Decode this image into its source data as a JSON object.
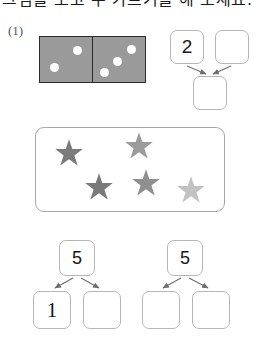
{
  "worksheet": {
    "instruction_text": "그림을 보고 수 가르기를 해 보세요.",
    "item_number": "(1)",
    "domino": {
      "name": "domino-tile",
      "left_pips": 2,
      "right_pips": 3,
      "fill_color": "#9a9a9a",
      "border_color": "#2b2b2b",
      "pip_color": "#ffffff",
      "left_pip_positions": [
        {
          "x": 33,
          "y": 9
        },
        {
          "x": 10,
          "y": 26
        }
      ],
      "right_pip_positions": [
        {
          "x": 34,
          "y": 8
        },
        {
          "x": 20,
          "y": 20
        },
        {
          "x": 7,
          "y": 31
        }
      ]
    },
    "top_bond": {
      "name": "top-number-bond",
      "left_box_value": "2",
      "right_box_value": "",
      "result_box_value": "",
      "box_border_color": "#b6b6b6",
      "arrow_color": "#6e6e6e"
    },
    "star_panel": {
      "name": "star-panel",
      "border_color": "#a8a8a8",
      "star_count": 5,
      "stars": [
        {
          "label": "star-1",
          "x": 18,
          "y": 10,
          "size": 30,
          "color": "#7b7b7b"
        },
        {
          "label": "star-2",
          "x": 88,
          "y": 3,
          "size": 30,
          "color": "#9b9b9b"
        },
        {
          "label": "star-3",
          "x": 48,
          "y": 44,
          "size": 30,
          "color": "#7a7a7a"
        },
        {
          "label": "star-4",
          "x": 95,
          "y": 40,
          "size": 30,
          "color": "#8f8f8f"
        },
        {
          "label": "star-5",
          "x": 140,
          "y": 47,
          "size": 30,
          "color": "#c2c2c2"
        }
      ]
    },
    "bottom_bonds": [
      {
        "name": "bottom-number-bond-left",
        "top_box_value": "5",
        "left_box_value": "1",
        "right_box_value": ""
      },
      {
        "name": "bottom-number-bond-right",
        "top_box_value": "5",
        "left_box_value": "",
        "right_box_value": ""
      }
    ]
  }
}
